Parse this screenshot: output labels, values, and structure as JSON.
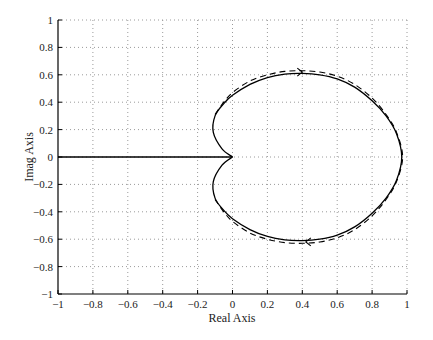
{
  "chart_data": {
    "type": "line",
    "title": "",
    "xlabel": "Real Axis",
    "ylabel": "Imag Axis",
    "xlim": [
      -1,
      1
    ],
    "ylim": [
      -1,
      1
    ],
    "grid": true,
    "grid_style": "dotted",
    "xticks": [
      -1,
      -0.8,
      -0.6,
      -0.4,
      -0.2,
      0,
      0.2,
      0.4,
      0.6,
      0.8,
      1
    ],
    "yticks": [
      -1,
      -0.8,
      -0.6,
      -0.4,
      -0.2,
      0,
      0.2,
      0.4,
      0.6,
      0.8,
      1
    ],
    "xtick_labels": [
      "−1",
      "−0.8",
      "−0.6",
      "−0.4",
      "−0.2",
      "0",
      "0.2",
      "0.4",
      "0.6",
      "0.8",
      "1"
    ],
    "ytick_labels": [
      "−1",
      "−0.8",
      "−0.6",
      "−0.4",
      "−0.2",
      "0",
      "0.2",
      "0.4",
      "0.6",
      "0.8",
      "1"
    ],
    "series": [
      {
        "name": "horizontal-segment",
        "style": "solid",
        "color": "#000000",
        "x": [
          -1,
          0
        ],
        "y": [
          0,
          0
        ]
      },
      {
        "name": "nyquist-solid",
        "style": "solid",
        "color": "#000000",
        "x": [
          0,
          -0.06,
          -0.11,
          -0.1,
          -0.05,
          0.0,
          0.1,
          0.2,
          0.3,
          0.4,
          0.5,
          0.6,
          0.7,
          0.8,
          0.88,
          0.94,
          0.97,
          0.94,
          0.88,
          0.8,
          0.7,
          0.6,
          0.5,
          0.4,
          0.3,
          0.2,
          0.1,
          0.0,
          -0.05,
          -0.1,
          -0.11,
          -0.06,
          0
        ],
        "y": [
          0,
          0.06,
          0.18,
          0.3,
          0.39,
          0.45,
          0.53,
          0.58,
          0.605,
          0.61,
          0.6,
          0.57,
          0.51,
          0.41,
          0.3,
          0.17,
          0,
          -0.17,
          -0.3,
          -0.41,
          -0.51,
          -0.57,
          -0.6,
          -0.61,
          -0.605,
          -0.58,
          -0.53,
          -0.45,
          -0.39,
          -0.3,
          -0.18,
          -0.06,
          0
        ]
      },
      {
        "name": "nyquist-dashed",
        "style": "dashed",
        "color": "#000000",
        "x": [
          -0.1,
          -0.05,
          0.0,
          0.1,
          0.2,
          0.3,
          0.4,
          0.5,
          0.6,
          0.7,
          0.8,
          0.88,
          0.94,
          0.975,
          0.94,
          0.88,
          0.8,
          0.7,
          0.6,
          0.5,
          0.4,
          0.3,
          0.2,
          0.1,
          0.0,
          -0.05,
          -0.1
        ],
        "y": [
          0.31,
          0.4,
          0.47,
          0.555,
          0.6,
          0.625,
          0.63,
          0.62,
          0.59,
          0.53,
          0.43,
          0.31,
          0.18,
          0,
          -0.18,
          -0.31,
          -0.43,
          -0.53,
          -0.59,
          -0.62,
          -0.63,
          -0.625,
          -0.6,
          -0.555,
          -0.47,
          -0.4,
          -0.31
        ]
      }
    ],
    "annotations": [
      {
        "type": "arrow",
        "x": 0.4,
        "y": 0.62,
        "direction": "right"
      },
      {
        "type": "arrow",
        "x": 0.42,
        "y": -0.62,
        "direction": "left"
      }
    ]
  }
}
